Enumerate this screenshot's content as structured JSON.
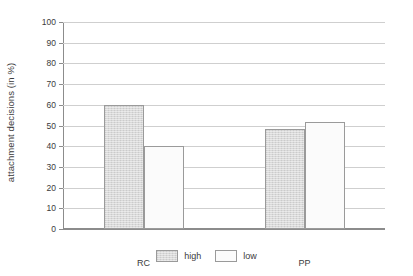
{
  "chart_data": {
    "type": "bar",
    "title": "",
    "xlabel": "",
    "ylabel": "attachment decisions (in %)",
    "categories": [
      "RC",
      "PP"
    ],
    "series": [
      {
        "name": "high",
        "values": [
          60,
          48.5
        ],
        "color": "#d9d9d9"
      },
      {
        "name": "low",
        "values": [
          40,
          51.5
        ],
        "color": "#fbfbfb"
      }
    ],
    "ylim": [
      0,
      100
    ],
    "ytick_labels": [
      "100",
      "90",
      "80",
      "70",
      "60",
      "50",
      "40",
      "30",
      "20",
      "10",
      "0"
    ],
    "ytick_values": [
      100,
      90,
      80,
      70,
      60,
      50,
      40,
      30,
      20,
      10,
      0
    ],
    "grid": true,
    "legend_position": "bottom",
    "legend_entries": [
      "high",
      "low"
    ],
    "axis_color": "#8c8c8c",
    "grid_color": "#cfcfcf",
    "bar_border_color": "#9a9a9a"
  }
}
